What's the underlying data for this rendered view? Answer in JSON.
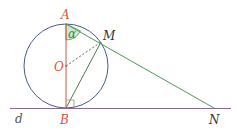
{
  "diagram": {
    "type": "geometry",
    "points": {
      "A": {
        "label": "A",
        "x": 66,
        "y": 24
      },
      "O": {
        "label": "O",
        "x": 66,
        "y": 66
      },
      "B": {
        "label": "B",
        "x": 66,
        "y": 108
      },
      "M": {
        "label": "M",
        "x": 101,
        "y": 42
      },
      "N": {
        "label": "N",
        "x": 214,
        "y": 108
      }
    },
    "line_label": "d",
    "angle_label": "α",
    "circle": {
      "cx": 66,
      "cy": 66,
      "r": 42
    },
    "colors": {
      "circle": "#4a5a8c",
      "diameter": "#d9533a",
      "secant": "#4f9a5a",
      "tangent": "#8a6a8a",
      "angle_fill": "#cfe8cf",
      "red_label": "#d9533a",
      "dark_label": "#333333",
      "green_label": "#3a8a4a"
    }
  }
}
